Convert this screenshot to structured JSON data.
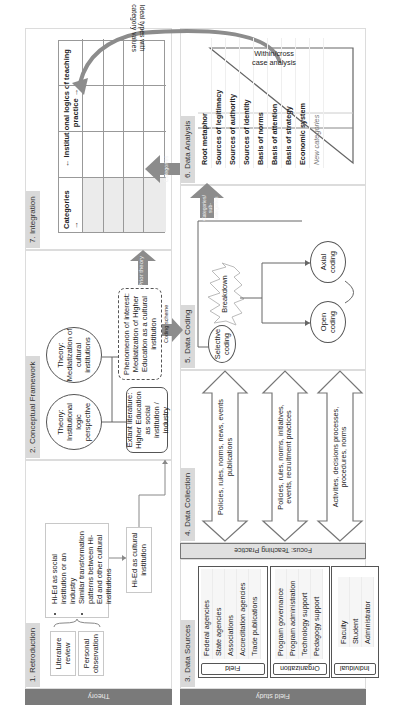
{
  "strips": {
    "theory": "Theory",
    "field_study": "Field study"
  },
  "panels": {
    "retroduction": {
      "title": "1. Retroduction",
      "inputs": [
        "Literature review",
        "Personal observation"
      ],
      "bullets": [
        "Hi-Ed as social institution or an industry",
        "Similar transformation patterns between Hi-Ed and other cultural institutions"
      ],
      "result": "Hi-Ed as cultural institution"
    },
    "conceptual_framework": {
      "title": "2. Conceptual Framework",
      "theory_1": "Theory: Institutional logic perspective",
      "theory_2": "Theory: Mediatization of cultural institutions",
      "extant_literature": "Extant literature: Higher Education as social institution / industry",
      "phenomenon": "Phenomenon of interest: Mediatization of Higher Education as a cultural institution"
    },
    "integration": {
      "title": "7. Integration",
      "row_header": "Categories →",
      "col_header": "← Institutional logics of teaching practice →"
    },
    "data_sources": {
      "title": "3. Data Sources",
      "groups": [
        {
          "label": "Field",
          "items": [
            "Federal agencies",
            "State agencies",
            "Associations",
            "Accreditation agencies",
            "Trade publications"
          ]
        },
        {
          "label": "Organization",
          "items": [
            "Program governance",
            "Program administration",
            "Technology support",
            "Pedagogy support"
          ]
        },
        {
          "label": "Individual",
          "items": [
            "Faculty",
            "Student",
            "Administrator"
          ]
        }
      ]
    },
    "focus_bar": "Focus: Teaching Practice",
    "data_collection": {
      "title": "4. Data Collection",
      "arrows": [
        "Policies, rules, norms, news, events publications",
        "Policies, rules, norms, initiatives, events, recruitment practices",
        "Activities, decisions processes, procedures, norms"
      ]
    },
    "data_coding": {
      "title": "5. Data Coding",
      "selective": "Selective coding",
      "breakdown": "Breakdown",
      "open": "Open coding",
      "axial": "Axial coding"
    },
    "data_analysis": {
      "title": "6. Data Analysis",
      "categories": [
        "Root metaphor",
        "Sources of legitimacy",
        "Sources of authority",
        "Sources of identity",
        "Basis of norms",
        "Basis of attention",
        "Basis of strategy",
        "Economic system"
      ],
      "new_categories": "New categories",
      "triangle_label": "Within/cross case analysis",
      "curve_label": "Ideal types with category values"
    }
  },
  "flow_arrows": {
    "prior_theory": "Prior theory",
    "coding_scheme": "Coding scheme",
    "categories_sub": "Categories/ sub-categories",
    "categories": "Categories"
  },
  "colors": {
    "strip": "#7a7a7a",
    "header": "#d9d9d9",
    "arrow_fill": "#8c8c8c",
    "focus": "#e0e0e0"
  }
}
